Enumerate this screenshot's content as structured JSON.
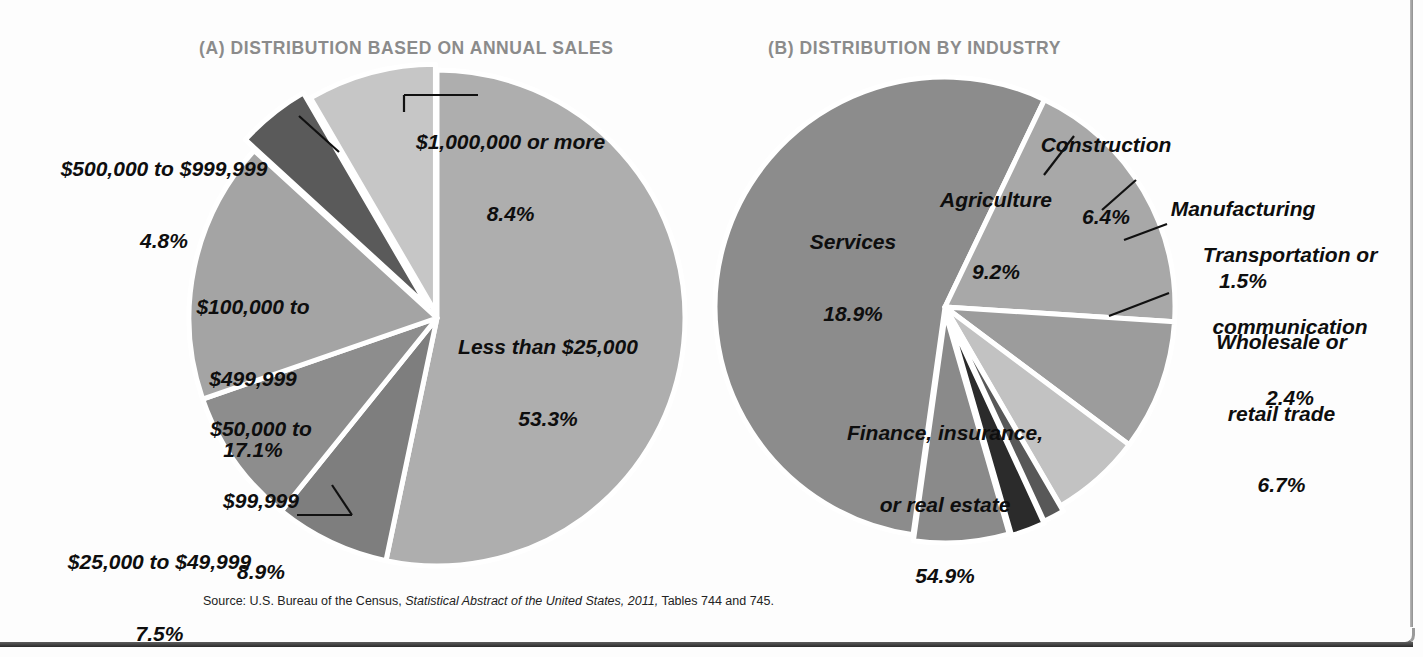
{
  "figure": {
    "source_prefix": "Source: U.S. Bureau of the Census,",
    "source_italic": "Statistical Abstract of the United States, 2011,",
    "source_suffix": "Tables 744 and 745."
  },
  "panel_a": {
    "title": "(A) DISTRIBUTION BASED ON ANNUAL SALES"
  },
  "panel_b": {
    "title": "(B) DISTRIBUTION BY INDUSTRY"
  },
  "labels_a": [
    {
      "name": "Less than $25,000",
      "pct": "53.3%"
    },
    {
      "name": "$25,000 to $49,999",
      "pct": "7.5%"
    },
    {
      "name_l1": "$50,000 to",
      "name_l2": "$99,999",
      "pct": "8.9%"
    },
    {
      "name_l1": "$100,000 to",
      "name_l2": "$499,999",
      "pct": "17.1%"
    },
    {
      "name": "$500,000 to $999,999",
      "pct": "4.8%"
    },
    {
      "name": "$1,000,000 or more",
      "pct": "8.4%"
    }
  ],
  "labels_b": [
    {
      "name": "Finance, insurance,",
      "name2": "or real estate",
      "pct": "54.9%"
    },
    {
      "name": "Services",
      "pct": "18.9%"
    },
    {
      "name": "Agriculture",
      "pct": "9.2%"
    },
    {
      "name": "Construction",
      "pct": "6.4%"
    },
    {
      "name": "Manufacturing",
      "pct": "1.5%"
    },
    {
      "name": "Transportation or",
      "name2": "communication",
      "pct": "2.4%"
    },
    {
      "name": "Wholesale or",
      "name2": "retail trade",
      "pct": "6.7%"
    }
  ],
  "chart_data": [
    {
      "type": "pie",
      "title": "(A) DISTRIBUTION BASED ON ANNUAL SALES",
      "categories": [
        "Less than $25,000",
        "$25,000 to $49,999",
        "$50,000 to $99,999",
        "$100,000 to $499,999",
        "$500,000 to $999,999",
        "$1,000,000 or more"
      ],
      "values": [
        53.3,
        7.5,
        8.9,
        17.1,
        4.8,
        8.4
      ],
      "unit": "percent",
      "colors": [
        "#aeaeae",
        "#7e7e7e",
        "#8d8d8d",
        "#a4a4a4",
        "#5a5a5a",
        "#c6c6c6"
      ],
      "start_angle_deg": 0,
      "direction": "clockwise",
      "legend": "labels-on-slices",
      "grid": false
    },
    {
      "type": "pie",
      "title": "(B) DISTRIBUTION BY INDUSTRY",
      "categories": [
        "Finance, insurance, or real estate",
        "Services",
        "Agriculture",
        "Construction",
        "Manufacturing",
        "Transportation or communication",
        "Wholesale or retail trade"
      ],
      "values": [
        54.9,
        18.9,
        9.2,
        6.4,
        1.5,
        2.4,
        6.7
      ],
      "unit": "percent",
      "colors": [
        "#8c8c8c",
        "#a8a8a8",
        "#9c9c9c",
        "#c2c2c2",
        "#585858",
        "#2b2b2b",
        "#8a8a8a"
      ],
      "start_angle_deg": 188,
      "direction": "clockwise",
      "legend": "labels-on-slices-and-callouts",
      "grid": false
    }
  ]
}
